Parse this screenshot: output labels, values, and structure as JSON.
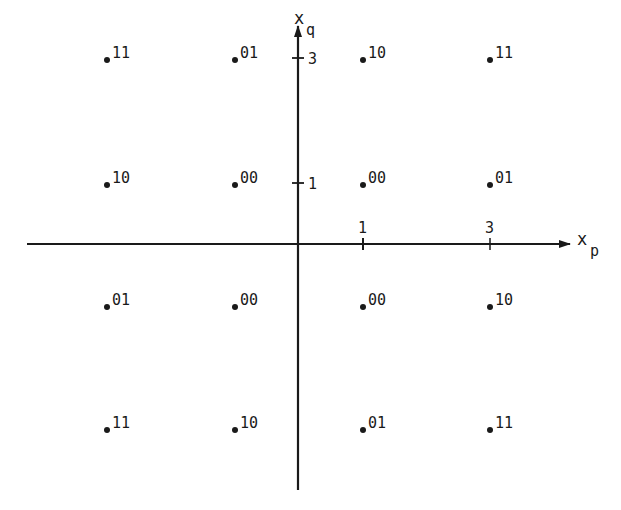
{
  "diagram": {
    "type": "signal-constellation",
    "axes": {
      "horizontal": {
        "label": "x",
        "subscript": "p",
        "ticks": [
          "1",
          "3"
        ]
      },
      "vertical": {
        "label": "x",
        "subscript": "q",
        "ticks": [
          "1",
          "3"
        ]
      }
    },
    "points": [
      {
        "p": -3,
        "q": 3,
        "label": "11"
      },
      {
        "p": -1,
        "q": 3,
        "label": "01"
      },
      {
        "p": 1,
        "q": 3,
        "label": "10"
      },
      {
        "p": 3,
        "q": 3,
        "label": "11"
      },
      {
        "p": -3,
        "q": 1,
        "label": "10"
      },
      {
        "p": -1,
        "q": 1,
        "label": "00"
      },
      {
        "p": 1,
        "q": 1,
        "label": "00"
      },
      {
        "p": 3,
        "q": 1,
        "label": "01"
      },
      {
        "p": -3,
        "q": -1,
        "label": "01"
      },
      {
        "p": -1,
        "q": -1,
        "label": "00"
      },
      {
        "p": 1,
        "q": -1,
        "label": "00"
      },
      {
        "p": 3,
        "q": -1,
        "label": "10"
      },
      {
        "p": -3,
        "q": -3,
        "label": "11"
      },
      {
        "p": -1,
        "q": -3,
        "label": "10"
      },
      {
        "p": 1,
        "q": -3,
        "label": "01"
      },
      {
        "p": 3,
        "q": -3,
        "label": "11"
      }
    ],
    "colors": {
      "ink": "#1a1a1a",
      "background": "#ffffff"
    }
  }
}
